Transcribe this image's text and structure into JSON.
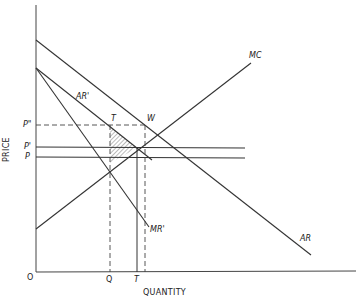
{
  "diagram": {
    "type": "economics-supply-demand",
    "axes": {
      "x_label": "QUANTITY",
      "y_label": "PRICE",
      "origin_label": "O"
    },
    "curves": {
      "ar": "AR",
      "ar_prime": "AR'",
      "mr_prime": "MR'",
      "mc": "MC"
    },
    "price_levels": {
      "p_double_prime": "P\"",
      "p_prime": "P'",
      "p": "P"
    },
    "quantity_levels": {
      "q": "Q",
      "t": "T"
    },
    "points": {
      "t": "T",
      "w": "W"
    },
    "colors": {
      "line": "#333333",
      "background": "#ffffff"
    }
  }
}
